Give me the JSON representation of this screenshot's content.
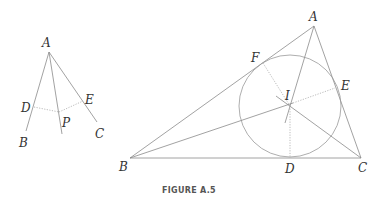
{
  "figure": {
    "caption": "FIGURE A.5",
    "left_diagram": {
      "description": "Angle A with rays AB and AC, bisector through P, perpendiculars PD and PE",
      "labels": {
        "A": "A",
        "B": "B",
        "C": "C",
        "D": "D",
        "E": "E",
        "P": "P"
      }
    },
    "right_diagram": {
      "description": "Triangle ABC with incircle centered at I, touching sides at D, E, F; angle bisectors meet at I",
      "labels": {
        "A": "A",
        "B": "B",
        "C": "C",
        "D": "D",
        "E": "E",
        "F": "F",
        "I": "I"
      }
    }
  }
}
